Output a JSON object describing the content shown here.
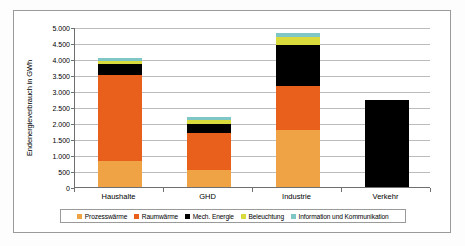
{
  "chart_data": {
    "type": "bar",
    "title": "",
    "subtitle": "",
    "xlabel": "",
    "ylabel": "Endenergieverbrauch in GWh",
    "categories": [
      "Haushalte",
      "GHD",
      "Industrie",
      "Verkehr"
    ],
    "ylim": [
      0,
      5000
    ],
    "ytick_labels": [
      "0",
      "500",
      "1.000",
      "1.500",
      "2.000",
      "2.500",
      "3.000",
      "3.500",
      "4.000",
      "4.500",
      "5.000"
    ],
    "ytick_values": [
      0,
      500,
      1000,
      1500,
      2000,
      2500,
      3000,
      3500,
      4000,
      4500,
      5000
    ],
    "grid": true,
    "stacked": true,
    "legend_position": "bottom",
    "series": [
      {
        "name": "Prozesswärme",
        "color": "#EFA344",
        "values": [
          820,
          520,
          1780,
          0
        ]
      },
      {
        "name": "Raumwärme",
        "color": "#E8601C",
        "values": [
          2670,
          1170,
          1380,
          0
        ]
      },
      {
        "name": "Mech. Energie",
        "color": "#000000",
        "values": [
          350,
          290,
          1290,
          2730
        ]
      },
      {
        "name": "Beleuchtung",
        "color": "#D9DB3C",
        "values": [
          90,
          130,
          240,
          0
        ]
      },
      {
        "name": "Information und Kommunikation",
        "color": "#7FC7C6",
        "values": [
          90,
          70,
          120,
          0
        ]
      }
    ],
    "totals": [
      4020,
      2180,
      4810,
      2730
    ]
  },
  "legend": {
    "items": [
      {
        "label": "Prozesswärme",
        "color": "#EFA344"
      },
      {
        "label": "Raumwärme",
        "color": "#E8601C"
      },
      {
        "label": "Mech. Energie",
        "color": "#000000"
      },
      {
        "label": "Beleuchtung",
        "color": "#D9DB3C"
      },
      {
        "label": "Information und Kommunikation",
        "color": "#7FC7C6"
      }
    ]
  }
}
